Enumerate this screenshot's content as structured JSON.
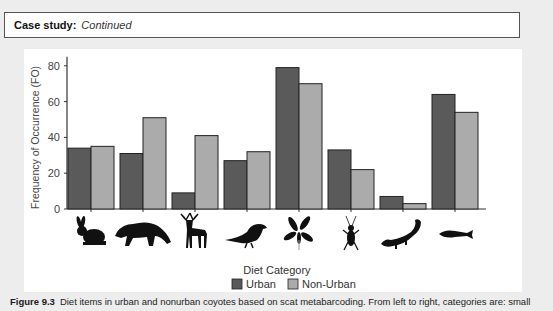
{
  "case_study": {
    "label": "Case study:",
    "subtitle": "Continued"
  },
  "colors": {
    "urban": "#5a5a5a",
    "non_urban": "#ababab",
    "background": "#ededed",
    "panel": "#ffffff"
  },
  "chart_data": {
    "type": "bar",
    "title": "",
    "xlabel": "Diet Category",
    "ylabel": "Frequency of Occurrence (FO)",
    "ylim": [
      0,
      85
    ],
    "yticks": [
      0,
      20,
      40,
      60,
      80
    ],
    "grid": false,
    "legend_position": "bottom",
    "categories": [
      "small mammal (rabbit)",
      "raccoon",
      "deer",
      "bird",
      "plant",
      "insect",
      "salamander",
      "fish"
    ],
    "category_icons": [
      "rabbit-icon",
      "raccoon-icon",
      "deer-icon",
      "bird-icon",
      "plant-icon",
      "insect-icon",
      "salamander-icon",
      "fish-icon"
    ],
    "series": [
      {
        "name": "Urban",
        "color": "#5a5a5a",
        "values": [
          34,
          31,
          9,
          27,
          79,
          33,
          7,
          64
        ]
      },
      {
        "name": "Non-Urban",
        "color": "#ababab",
        "values": [
          35,
          51,
          41,
          32,
          70,
          22,
          3,
          54
        ]
      }
    ]
  },
  "legend": {
    "urban": "Urban",
    "non_urban": "Non-Urban"
  },
  "caption": {
    "figure": "Figure 9.3",
    "text": "Diet items in urban and nonurban coyotes based on scat metabarcoding. From left to right, categories are: small"
  }
}
